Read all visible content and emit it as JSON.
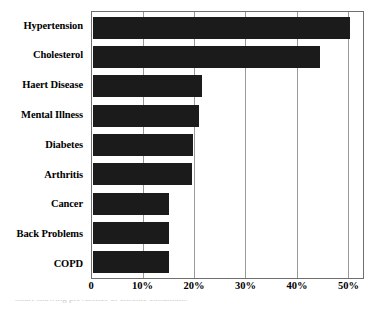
{
  "chart_data": {
    "type": "bar",
    "orientation": "horizontal",
    "title": "",
    "subtitle": "",
    "xlabel": "",
    "ylabel": "",
    "categories": [
      "Hypertension",
      "Cholesterol",
      "Haert Disease",
      "Mental Illness",
      "Diabetes",
      "Arthritis",
      "Cancer",
      "Back Problems",
      "COPD"
    ],
    "values": [
      50.5,
      44.5,
      21.5,
      21.0,
      19.8,
      19.5,
      15.1,
      15.1,
      15.1
    ],
    "value_unit": "%",
    "xlim": [
      0,
      53
    ],
    "ticks": [
      {
        "value": 0,
        "label": "0"
      },
      {
        "value": 10,
        "label": "10%"
      },
      {
        "value": 20,
        "label": "20%"
      },
      {
        "value": 30,
        "label": "30%"
      },
      {
        "value": 40,
        "label": "40%"
      },
      {
        "value": 50,
        "label": "50%"
      }
    ],
    "grid": true,
    "legend": false,
    "legend_position": "none",
    "bar_color": "#1b1b1b",
    "grid_color": "#9a9a9a",
    "frame_color": "#6f6f6f",
    "background_color": "#ffffff"
  },
  "caption": {
    "sliver_text": "Chart showing prevalence of chronic conditions"
  }
}
